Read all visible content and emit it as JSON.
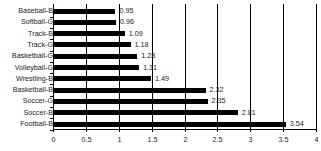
{
  "chart_data": {
    "type": "bar",
    "orientation": "horizontal",
    "title": "",
    "xlabel": "",
    "ylabel": "",
    "categories": [
      "Baseball-B",
      "Softball-G",
      "Track-B",
      "Track-G",
      "Basketball-G",
      "Volleyball-G",
      "Wrestling-B",
      "Basketball-B",
      "Soccer-G",
      "Soccer-B",
      "Football-B"
    ],
    "values": [
      0.95,
      0.96,
      1.09,
      1.18,
      1.28,
      1.31,
      1.49,
      2.32,
      2.35,
      2.81,
      3.54
    ],
    "value_labels": [
      "0.95",
      "0.96",
      "1.09",
      "1.18",
      "1.28",
      "1.31",
      "1.49",
      "2.32",
      "2.35",
      "2.81",
      "3.54"
    ],
    "xlim": [
      0,
      4
    ],
    "xticks": [
      "0",
      "0.5",
      "1",
      "1.5",
      "2",
      "2.5",
      "3",
      "3.5",
      "4"
    ],
    "grid": "vertical",
    "legend": "none",
    "bar_color": "#000000"
  }
}
